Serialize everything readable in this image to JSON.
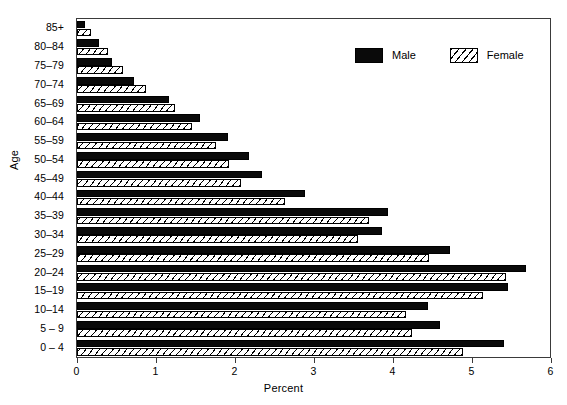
{
  "chart_data": {
    "type": "bar",
    "orientation": "horizontal",
    "title": "",
    "xlabel": "Percent",
    "ylabel": "Age",
    "xlim": [
      0,
      6
    ],
    "xticks": [
      0,
      1,
      2,
      3,
      4,
      5,
      6
    ],
    "xtick_labels": [
      "0",
      "1",
      "2",
      "3",
      "4",
      "5",
      "6"
    ],
    "grid": false,
    "legend_position": "top-right",
    "categories": [
      "85+",
      "80–84",
      "75–79",
      "70–74",
      "65–69",
      "60–64",
      "55–59",
      "50–54",
      "45–49",
      "40–44",
      "35–39",
      "30–34",
      "25–29",
      "20–24",
      "15–19",
      "10–14",
      "5 – 9",
      "0 – 4"
    ],
    "series": [
      {
        "name": "Male",
        "color": "#0a0a0a",
        "fill": "solid",
        "values": [
          0.1,
          0.28,
          0.44,
          0.72,
          1.16,
          1.56,
          1.91,
          2.18,
          2.34,
          2.89,
          3.94,
          3.86,
          4.72,
          5.68,
          5.46,
          4.44,
          4.59,
          5.4
        ]
      },
      {
        "name": "Female",
        "color": "#ffffff",
        "fill": "hatched",
        "values": [
          0.18,
          0.39,
          0.58,
          0.87,
          1.24,
          1.46,
          1.76,
          1.92,
          2.07,
          2.63,
          3.69,
          3.56,
          4.45,
          5.43,
          5.14,
          4.16,
          4.24,
          4.89
        ]
      }
    ]
  },
  "legend": {
    "items": [
      {
        "label": "Male",
        "fill": "solid"
      },
      {
        "label": "Female",
        "fill": "hatched"
      }
    ]
  },
  "axes": {
    "x_title": "Percent",
    "y_title": "Age"
  }
}
